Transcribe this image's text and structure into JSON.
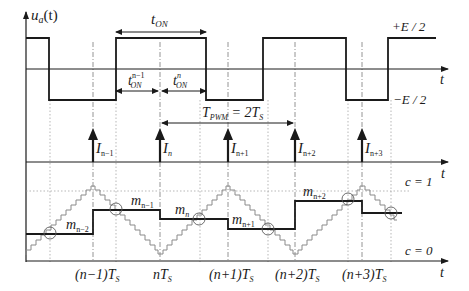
{
  "diagram": {
    "top_panel": {
      "y_label": "u_a(t)",
      "y_label_main": "u",
      "y_label_sub": "a",
      "y_label_arg": "(t)",
      "x_label": "t",
      "high_level": "+E / 2",
      "low_level": "−E / 2",
      "t_on": {
        "main": "t",
        "sub": "ON"
      },
      "t_on_prev": {
        "main": "t",
        "sub": "ON",
        "sup": "n−1"
      },
      "t_on_n": {
        "main": "t",
        "sub": "ON",
        "sup": "n"
      }
    },
    "middle_panel": {
      "x_label": "t",
      "period_label": {
        "main": "T",
        "sub": "PWM",
        "rest": " = 2T",
        "rest_sub": "S"
      },
      "pulses": [
        {
          "main": "I",
          "sub": "n−1"
        },
        {
          "main": "I",
          "sub": "n"
        },
        {
          "main": "I",
          "sub": "n+1"
        },
        {
          "main": "I",
          "sub": "n+2"
        },
        {
          "main": "I",
          "sub": "n+3"
        }
      ]
    },
    "bottom_panel": {
      "x_label": "t",
      "c_high": "c = 1",
      "c_low": "c = 0",
      "modulating_levels": [
        {
          "main": "m",
          "sub": "n−2"
        },
        {
          "main": "m",
          "sub": "n−1"
        },
        {
          "main": "m",
          "sub": "n"
        },
        {
          "main": "m",
          "sub": "n+1"
        },
        {
          "main": "m",
          "sub": "n+2"
        }
      ],
      "time_ticks": [
        {
          "pre": "(n−1)T",
          "sub": "S"
        },
        {
          "pre": "nT",
          "sub": "S"
        },
        {
          "pre": "(n+1)T",
          "sub": "S"
        },
        {
          "pre": "(n+2)T",
          "sub": "S"
        },
        {
          "pre": "(n+3)T",
          "sub": "S"
        }
      ]
    },
    "colors": {
      "waveform": "#1a1a1a",
      "carrier": "#8a8a8a",
      "grid": "#9a9a9a"
    }
  }
}
